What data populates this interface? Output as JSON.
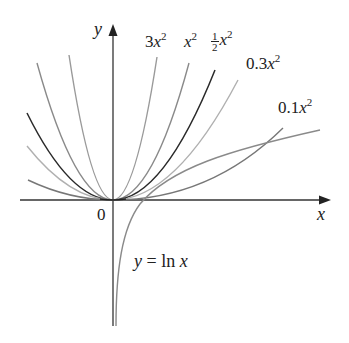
{
  "chart_data": {
    "type": "line",
    "title": "",
    "xlabel": "x",
    "ylabel": "y",
    "origin_label": "0",
    "grid": false,
    "legend_position": "inline labels at curve ends",
    "series": [
      {
        "name": "3x^2",
        "label": "3x",
        "coef": 3.0,
        "color": "#9a9a9a",
        "x_range": [
          -0.85,
          0.85
        ]
      },
      {
        "name": "x^2",
        "label": "x",
        "coef": 1.0,
        "color": "#8a8a8a",
        "x_range": [
          -1.55,
          1.55
        ]
      },
      {
        "name": "1/2 x^2",
        "label": "x",
        "coef": 0.5,
        "color": "#2a2a2a",
        "x_range": [
          -2.0,
          2.0
        ]
      },
      {
        "name": "0.3x^2",
        "label": "0.3x",
        "coef": 0.3,
        "color": "#b0b0b0",
        "x_range": [
          -2.3,
          2.4
        ]
      },
      {
        "name": "0.1x^2",
        "label": "0.1x",
        "coef": 0.1,
        "color": "#777777",
        "x_range": [
          -2.5,
          4.2
        ]
      },
      {
        "name": "y = ln x",
        "label": "y = ln x",
        "color": "#8a8a8a",
        "x_range": [
          0.02,
          5.0
        ]
      }
    ],
    "annotations": [
      "3x^2",
      "x^2",
      "1/2 x^2",
      "0.3x^2",
      "0.1x^2",
      "y = ln x"
    ]
  },
  "labels": {
    "y_axis": "y",
    "x_axis": "x",
    "origin": "0",
    "c3": "3x",
    "c1": "x",
    "c_half_num": "1",
    "c_half_den": "2",
    "c_half": "x",
    "c03": "0.3x",
    "c01": "0.1x",
    "sq": "2",
    "ln_y": "y",
    "ln_eq": " = ln ",
    "ln_x": "x"
  }
}
